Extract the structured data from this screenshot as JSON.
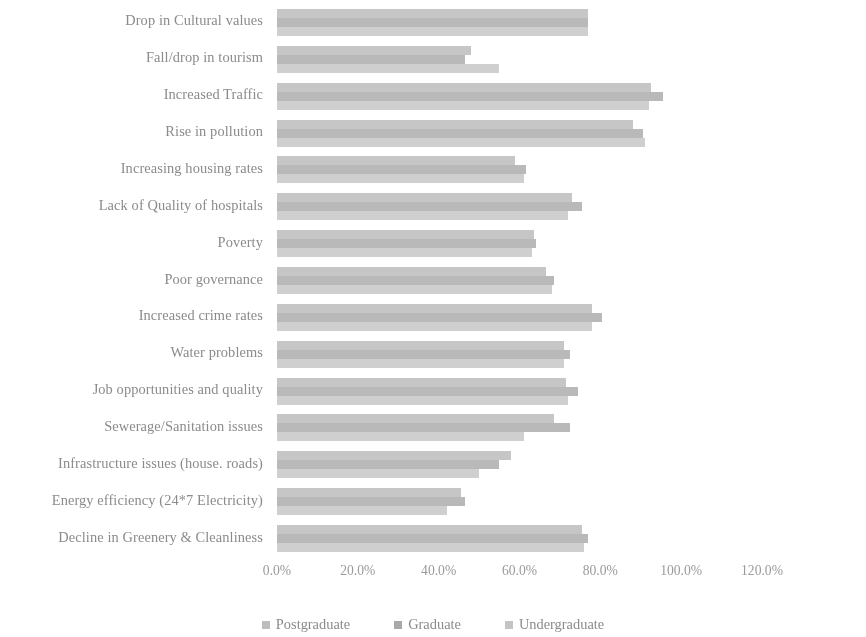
{
  "chart_data": {
    "type": "bar",
    "orientation": "horizontal",
    "title": "",
    "xlabel": "",
    "ylabel": "",
    "xlim": [
      0,
      120
    ],
    "xtick_labels": [
      "0.0%",
      "20.0%",
      "40.0%",
      "60.0%",
      "80.0%",
      "100.0%",
      "120.0%"
    ],
    "xtick_values": [
      0,
      20,
      40,
      60,
      80,
      100,
      120
    ],
    "grid": false,
    "legend_position": "bottom",
    "legend": [
      "Postgraduate",
      "Graduate",
      "Undergraduate"
    ],
    "categories": [
      "Drop in Cultural values",
      "Fall/drop in tourism",
      "Increased Traffic",
      "Rise in pollution",
      "Increasing housing rates",
      "Lack of Quality of hospitals",
      "Poverty",
      "Poor governance",
      "Increased crime rates",
      "Water problems",
      "Job opportunities and quality",
      "Sewerage/Sanitation issues",
      "Infrastructure issues (house. roads)",
      "Energy efficiency (24*7 Electricity)",
      "Decline in Greenery & Cleanliness"
    ],
    "series": [
      {
        "name": "Postgraduate",
        "color": "#cfcfcf",
        "values": [
          77.0,
          55.0,
          92.0,
          91.0,
          61.0,
          72.0,
          63.0,
          68.0,
          78.0,
          71.0,
          72.0,
          61.0,
          50.0,
          42.0,
          76.0
        ]
      },
      {
        "name": "Graduate",
        "color": "#b9b9b9",
        "values": [
          77.0,
          46.5,
          95.5,
          90.5,
          61.5,
          75.5,
          64.0,
          68.5,
          80.5,
          72.5,
          74.5,
          72.5,
          55.0,
          46.5,
          77.0
        ]
      },
      {
        "name": "Undergraduate",
        "color": "#c6c6c6",
        "values": [
          77.0,
          48.0,
          92.5,
          88.0,
          59.0,
          73.0,
          63.5,
          66.5,
          78.0,
          71.0,
          71.5,
          68.5,
          58.0,
          45.5,
          75.5
        ]
      }
    ]
  },
  "axis": {
    "ticks": [
      {
        "label": "0.0%",
        "value": 0
      },
      {
        "label": "20.0%",
        "value": 20
      },
      {
        "label": "40.0%",
        "value": 40
      },
      {
        "label": "60.0%",
        "value": 60
      },
      {
        "label": "80.0%",
        "value": 80
      },
      {
        "label": "100.0%",
        "value": 100
      },
      {
        "label": "120.0%",
        "value": 120
      }
    ]
  },
  "legend": {
    "items": [
      {
        "label": "Postgraduate",
        "key": "postgrad"
      },
      {
        "label": "Graduate",
        "key": "grad"
      },
      {
        "label": "Undergraduate",
        "key": "undergrad"
      }
    ]
  }
}
